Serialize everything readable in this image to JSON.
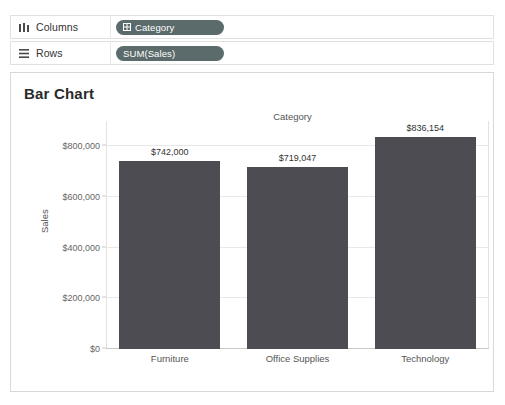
{
  "shelves": [
    {
      "name": "columns",
      "label": "Columns",
      "icon": "columns-icon",
      "pill": {
        "text": "Category",
        "type": "dimension",
        "icon": "dimension-grid-icon",
        "color": "#5b6b6b"
      }
    },
    {
      "name": "rows",
      "label": "Rows",
      "icon": "rows-icon",
      "pill": {
        "text": "SUM(Sales)",
        "type": "measure",
        "icon": "",
        "color": "#5b6b6b"
      }
    }
  ],
  "chart_card": {
    "title": "Bar Chart",
    "column_header": "Category"
  },
  "chart_data": {
    "type": "bar",
    "title": "Bar Chart",
    "xlabel": "Category",
    "ylabel": "Sales",
    "categories": [
      "Furniture",
      "Office Supplies",
      "Technology"
    ],
    "values": [
      742000,
      719047,
      836154
    ],
    "value_labels": [
      "$742,000",
      "$719,047",
      "$836,154"
    ],
    "ylim": [
      0,
      900000
    ],
    "yticks": [
      0,
      200000,
      400000,
      600000,
      800000
    ],
    "ytick_labels": [
      "$0",
      "$200,000",
      "$400,000",
      "$600,000",
      "$800,000"
    ],
    "grid": true,
    "legend": "none",
    "bar_color": "#4c4c52"
  }
}
